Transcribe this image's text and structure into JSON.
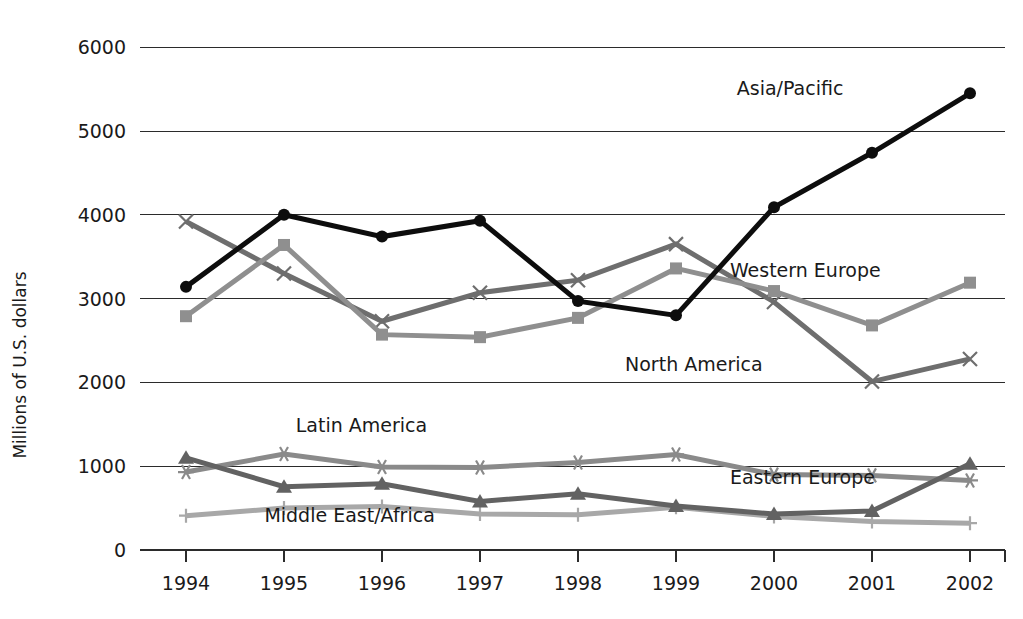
{
  "chart_data": {
    "type": "line",
    "title": "",
    "xlabel": "",
    "ylabel": "Millions of U.S. dollars",
    "categories": [
      "1994",
      "1995",
      "1996",
      "1997",
      "1998",
      "1999",
      "2000",
      "2001",
      "2002"
    ],
    "x": [
      1994,
      1995,
      1996,
      1997,
      1998,
      1999,
      2000,
      2001,
      2002
    ],
    "ylim": [
      0,
      6000
    ],
    "yticks": [
      0,
      1000,
      2000,
      3000,
      4000,
      5000,
      6000
    ],
    "ytick_labels": [
      "0",
      "1000",
      "2000",
      "3000",
      "4000",
      "5000",
      "6000"
    ],
    "grid": "horizontal",
    "legend": "inline-annotations",
    "series": [
      {
        "name": "Asia/Pacific",
        "color": "#0d0d0d",
        "marker": "circle",
        "width": 5,
        "label_x": 1999.62,
        "label_y": 5430,
        "label_anchor": "start",
        "values": [
          3140,
          4000,
          3740,
          3930,
          2970,
          2800,
          4090,
          4740,
          5450
        ]
      },
      {
        "name": "Western Europe",
        "color": "#8f8f8f",
        "marker": "square",
        "width": 5,
        "label_x": 1999.55,
        "label_y": 3260,
        "label_anchor": "start",
        "values": [
          2790,
          3640,
          2570,
          2540,
          2770,
          3360,
          3090,
          2680,
          3190
        ]
      },
      {
        "name": "North America",
        "color": "#6e6e6e",
        "marker": "x",
        "width": 5,
        "label_x": 1998.48,
        "label_y": 2140,
        "label_anchor": "start",
        "values": [
          3920,
          3300,
          2730,
          3070,
          3220,
          3650,
          2960,
          2010,
          2280
        ]
      },
      {
        "name": "Latin America",
        "color": "#8a8a8a",
        "marker": "asterisk",
        "width": 5,
        "label_x": 1995.12,
        "label_y": 1410,
        "label_anchor": "start",
        "values": [
          930,
          1145,
          990,
          985,
          1045,
          1140,
          900,
          890,
          830
        ]
      },
      {
        "name": "Eastern Europe",
        "color": "#626262",
        "marker": "triangle",
        "width": 5,
        "label_x": 1999.55,
        "label_y": 790,
        "label_anchor": "start",
        "values": [
          1100,
          755,
          790,
          580,
          670,
          525,
          430,
          465,
          1030
        ]
      },
      {
        "name": "Middle East/Africa",
        "color": "#a8a8a8",
        "marker": "plus",
        "width": 5,
        "label_x": 1994.8,
        "label_y": 330,
        "label_anchor": "start",
        "values": [
          410,
          500,
          520,
          430,
          420,
          510,
          400,
          340,
          320
        ]
      }
    ]
  },
  "annotations": {
    "asia_pacific": "Asia/Pacific",
    "western_europe": "Western Europe",
    "north_america": "North America",
    "latin_america": "Latin America",
    "eastern_europe": "Eastern Europe",
    "middle_east_africa": "Middle East/Africa"
  }
}
